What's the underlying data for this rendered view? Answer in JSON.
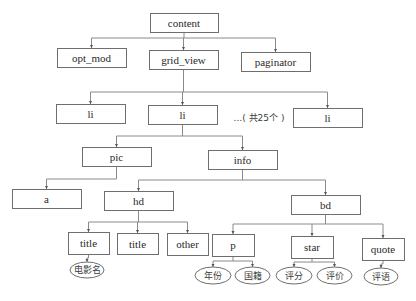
{
  "diagram": {
    "type": "tree",
    "nodes": [
      {
        "id": "content",
        "label": "content",
        "shape": "box",
        "parent": null
      },
      {
        "id": "opt_mod",
        "label": "opt_mod",
        "shape": "box",
        "parent": "content"
      },
      {
        "id": "grid_view",
        "label": "grid_view",
        "shape": "box",
        "parent": "content"
      },
      {
        "id": "paginator",
        "label": "paginator",
        "shape": "box",
        "parent": "content"
      },
      {
        "id": "li1",
        "label": "li",
        "shape": "box",
        "parent": "grid_view"
      },
      {
        "id": "li2",
        "label": "li",
        "shape": "box",
        "parent": "grid_view"
      },
      {
        "id": "li3",
        "label": "li",
        "shape": "box",
        "parent": "grid_view"
      },
      {
        "id": "pic",
        "label": "pic",
        "shape": "box",
        "parent": "li2"
      },
      {
        "id": "info",
        "label": "info",
        "shape": "box",
        "parent": "li2"
      },
      {
        "id": "a",
        "label": "a",
        "shape": "box",
        "parent": "pic"
      },
      {
        "id": "hd",
        "label": "hd",
        "shape": "box",
        "parent": "info"
      },
      {
        "id": "bd",
        "label": "bd",
        "shape": "box",
        "parent": "info"
      },
      {
        "id": "title1",
        "label": "title",
        "shape": "box",
        "parent": "hd"
      },
      {
        "id": "title2",
        "label": "title",
        "shape": "box",
        "parent": "hd"
      },
      {
        "id": "other",
        "label": "other",
        "shape": "box",
        "parent": "hd"
      },
      {
        "id": "p",
        "label": "p",
        "shape": "box",
        "parent": "bd"
      },
      {
        "id": "star",
        "label": "star",
        "shape": "box",
        "parent": "bd"
      },
      {
        "id": "quote",
        "label": "quote",
        "shape": "box",
        "parent": "bd"
      },
      {
        "id": "movie_name",
        "label": "电影名",
        "shape": "ellipse",
        "parent": "title1"
      },
      {
        "id": "year",
        "label": "年份",
        "shape": "ellipse",
        "parent": "p"
      },
      {
        "id": "country",
        "label": "国籍",
        "shape": "ellipse",
        "parent": "p"
      },
      {
        "id": "rating",
        "label": "评分",
        "shape": "ellipse",
        "parent": "star"
      },
      {
        "id": "review_count",
        "label": "评价",
        "shape": "ellipse",
        "parent": "star"
      },
      {
        "id": "quote_text",
        "label": "评语",
        "shape": "ellipse",
        "parent": "quote"
      }
    ],
    "annotations": {
      "li_count_note": "...( 共25个 )"
    }
  }
}
